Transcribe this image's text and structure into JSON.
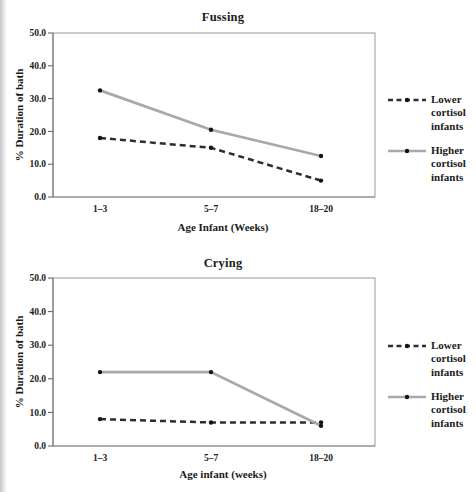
{
  "colors": {
    "dashed_line": "#2d2d2d",
    "solid_line": "#a9a9a9",
    "marker": "#141414",
    "plot_border": "#9a9a9a",
    "axis_line": "#7d7d7d",
    "axis_tick": "#5a5a5a",
    "text": "#1b1b1b",
    "page_edge": "#c7c7c7"
  },
  "legend": {
    "items": [
      {
        "label": "Lower cortisol infants",
        "style": "dashed"
      },
      {
        "label": "Higher cortisol infants",
        "style": "solid"
      }
    ]
  },
  "chart_data": [
    {
      "type": "line",
      "title": "Fussing",
      "xlabel": "Age Infant (Weeks)",
      "ylabel": "% Duration of bath",
      "categories": [
        "1–3",
        "5–7",
        "18–20"
      ],
      "y_ticks": [
        "50.0",
        "40.0",
        "30.0",
        "20.0",
        "10.0",
        "0.0"
      ],
      "ylim": [
        0,
        50
      ],
      "grid": false,
      "legend_position": "right",
      "series": [
        {
          "name": "Lower cortisol infants",
          "style": "dashed",
          "values": [
            18,
            15,
            5
          ]
        },
        {
          "name": "Higher cortisol infants",
          "style": "solid",
          "values": [
            32.5,
            20.5,
            12.5
          ]
        }
      ]
    },
    {
      "type": "line",
      "title": "Crying",
      "xlabel": "Age infant (weeks)",
      "ylabel": "% Duration of bath",
      "categories": [
        "1–3",
        "5–7",
        "18–20"
      ],
      "y_ticks": [
        "50.0",
        "40.0",
        "30.0",
        "20.0",
        "10.0",
        "0.0"
      ],
      "ylim": [
        0,
        50
      ],
      "grid": false,
      "legend_position": "right",
      "series": [
        {
          "name": "Lower cortisol infants",
          "style": "dashed",
          "values": [
            8,
            7,
            7
          ]
        },
        {
          "name": "Higher cortisol infants",
          "style": "solid",
          "values": [
            22,
            22,
            6
          ]
        }
      ]
    }
  ]
}
